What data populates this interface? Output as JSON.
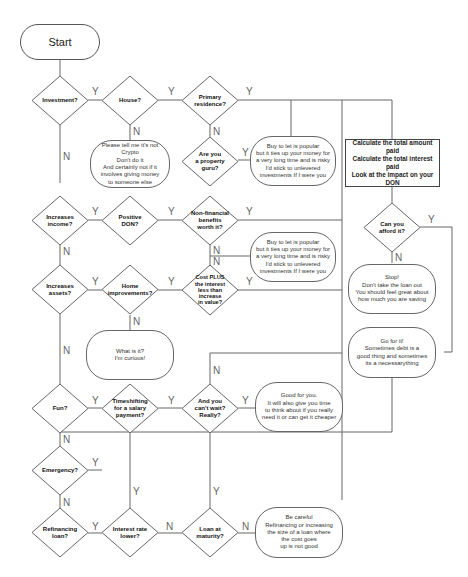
{
  "flowchart": {
    "start": "Start",
    "decisions": {
      "investment": "Investment?",
      "house": "House?",
      "primary_residence": "Primary\nresidence?",
      "property_guru": "Are you\na property\nguru?",
      "increases_income": "Increases\nincome?",
      "positive_don": "Positive\nDON?",
      "non_financial": "Non-financial\nbenefits\nworth it?",
      "increases_assets": "Increases\nassets?",
      "home_improvements": "Home\nimprovements?",
      "cost_plus": "Cost PLUS\nthe interest\nless than\nincrease\nin value?",
      "can_afford": "Can you\nafford it?",
      "fun": "Fun?",
      "timeshifting": "Timeshifting\nfor a salary\npayment?",
      "cant_wait": "And you\ncan't wait?\nReally?",
      "emergency": "Emergency?",
      "refinancing": "Refinancing\nloan?",
      "interest_rate_lower": "Interest rate\nlower?",
      "loan_at_maturity": "Loan at\nmaturity?"
    },
    "notes": {
      "crypto": "Please tell me it's not Crypto\nDon't do it\nAnd certainly not if it\ninvolves giving money\nto someone else",
      "buy_to_let_1": "Buy to let is popular\nbut it ties up your money for\na very long time and is risky\nI'd stick to unlevered\ninvestments If I were you",
      "buy_to_let_2": "Buy to let is popular\nbut it ties up your money for\na very long time and is risky\nI'd stick to unlevered\ninvestments If I were you",
      "curious": "What is it?\nI'm curious!",
      "stop": "Stop!\nDon't take the loan out\nYou should feel great about\nhow much you are saving",
      "go_for_it": "Go for it!\nSometimes debt is a\ngood thing and sometimes\nits a necessarything",
      "good_for_you": "Good for you.\nIt will also give you time\nto think about if you really\nneed it or can get it cheaper",
      "be_careful": "Be careful\nRefinancing or increasing\nthe size of a loan where\nthe cost goes\nup is not good"
    },
    "process": "Calculate the total amount paid\nCalculate the total interest paid\nLook at the impact on your DON",
    "labels": {
      "yes": "Y",
      "no": "N"
    }
  }
}
